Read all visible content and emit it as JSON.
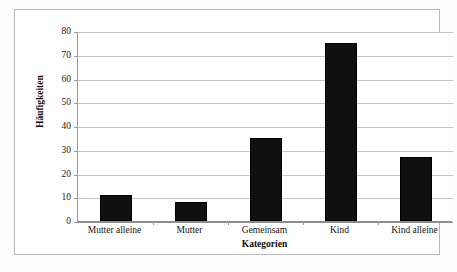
{
  "chart_data": {
    "type": "bar",
    "title": "",
    "subtitle": "",
    "categories": [
      "Mutter alleine",
      "Mutter",
      "Gemeinsam",
      "Kind",
      "Kind alleine"
    ],
    "values": [
      11,
      8,
      35,
      75,
      27
    ],
    "xlabel": "Kategorien",
    "ylabel": "Häufigkeiten",
    "ylim": [
      0,
      80
    ],
    "ytick_labels": [
      "0",
      "10",
      "20",
      "30",
      "40",
      "50",
      "60",
      "70",
      "80"
    ],
    "ytick_values": [
      0,
      10,
      20,
      30,
      40,
      50,
      60,
      70,
      80
    ],
    "grid": true,
    "grid_axis": "y",
    "legend": null,
    "legend_position": "none",
    "bar_color": "#101010",
    "gridline_color": "#c4c4c4",
    "axis_color": "#8d8d8d",
    "background_color": "#ffffff",
    "annotations": []
  }
}
